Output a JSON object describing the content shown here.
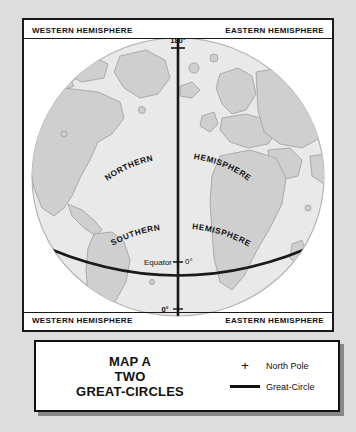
{
  "map": {
    "corner_labels": {
      "northwest": "WESTERN HEMISPHERE",
      "northeast": "EASTERN HEMISPHERE",
      "southwest": "WESTERN HEMISPHERE",
      "southeast": "EASTERN HEMISPHERE"
    },
    "globe_labels": {
      "northern": "NORTHERN",
      "northern_hemisphere": "HEMISPHERE",
      "southern": "SOUTHERN",
      "southern_hemisphere": "HEMISPHERE"
    },
    "axis_labels": {
      "top_meridian": "180°",
      "bottom_meridian": "0°",
      "equator_name": "Equator",
      "equator_degree": "0°"
    }
  },
  "legend": {
    "title_line1": "MAP A",
    "title_line2": "TWO",
    "title_line3": "GREAT-CIRCLES",
    "keys": [
      {
        "symbol": "plus-marker",
        "label": "North Pole"
      },
      {
        "symbol": "thick-line",
        "label": "Great-Circle"
      }
    ]
  },
  "colors": {
    "page_background": "#dddddd",
    "frame_background": "#ffffff",
    "frame_border": "#1a1a1a",
    "ocean": "#e9e9e9",
    "land": "#cfcfcf",
    "land_outline": "#9a9a9a",
    "globe_outline": "#b0b0b0",
    "great_circle": "#1a1a1a",
    "text": "#111111"
  }
}
